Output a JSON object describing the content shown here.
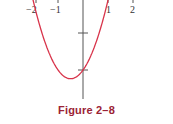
{
  "caption": "Figure 2–8",
  "colors": {
    "curve": "#d8334a",
    "axis": "#555555",
    "caption": "#9b2335"
  },
  "chart_data": {
    "type": "line",
    "title": "Figure 2–8",
    "xlabel": "",
    "ylabel": "",
    "function": "y = x^2 + x - 2",
    "x_tick_labels": [
      "−2",
      "−1",
      "1",
      "2"
    ],
    "x_ticks": [
      -2,
      -1,
      1,
      2
    ],
    "y_ticks": [
      -1,
      -2
    ],
    "xlim": [
      -2.3,
      2.5
    ],
    "ylim": [
      -3.1,
      0.1
    ],
    "series": [
      {
        "name": "parabola",
        "x": [
          -2.1,
          -2,
          -1.5,
          -1,
          -0.5,
          0,
          0.5,
          1,
          1.1
        ],
        "y": [
          0.31,
          0,
          -1.25,
          -2,
          -2.25,
          -2,
          -1.25,
          0,
          0.31
        ]
      }
    ],
    "grid": false,
    "legend": null
  }
}
